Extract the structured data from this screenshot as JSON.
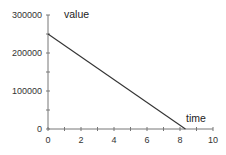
{
  "chart_data": {
    "type": "line",
    "title": "",
    "xlabel": "time",
    "ylabel": "value",
    "xlim": [
      0,
      10
    ],
    "ylim": [
      0,
      300000
    ],
    "x_ticks": [
      "0",
      "2",
      "4",
      "6",
      "8",
      "10"
    ],
    "x_minor_step": 1,
    "y_ticks": [
      "0",
      "100000",
      "200000",
      "300000"
    ],
    "y_minor_step": 50000,
    "grid": false,
    "legend": null,
    "series": [
      {
        "name": "value",
        "x": [
          0,
          8.33
        ],
        "values": [
          250000,
          0
        ],
        "color": "#333333"
      }
    ]
  },
  "colors": {
    "axis": "#777777",
    "line": "#333333",
    "text": "#333333"
  }
}
